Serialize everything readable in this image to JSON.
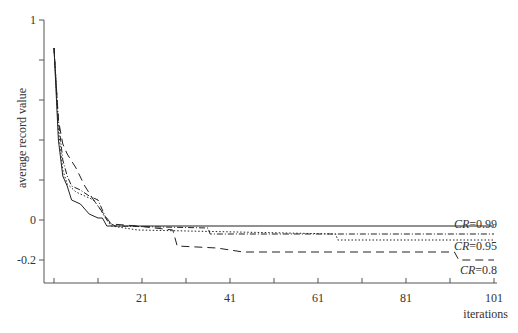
{
  "chart_data": {
    "type": "line",
    "title": "",
    "xlabel": "iterations",
    "ylabel": "average record value",
    "xlim": [
      1,
      101
    ],
    "ylim": [
      -0.3,
      1
    ],
    "x_ticks": [
      1,
      11,
      21,
      31,
      41,
      51,
      61,
      71,
      81,
      91,
      101
    ],
    "x_tick_labels": [
      "",
      "",
      "21",
      "",
      "41",
      "",
      "61",
      "",
      "81",
      "",
      "101"
    ],
    "y_ticks": [
      1,
      0.8,
      0.6,
      0.4,
      0.2,
      0,
      -0.2
    ],
    "y_tick_labels": [
      "1",
      "",
      "",
      "",
      "",
      "0",
      "-0.2"
    ],
    "grid": false,
    "legend": "inline labels at right end of lines",
    "series": [
      {
        "name": "CR=0.99",
        "style": "dash-dot",
        "points": [
          [
            1,
            0.86
          ],
          [
            2,
            0.5
          ],
          [
            3,
            0.3
          ],
          [
            4,
            0.22
          ],
          [
            5,
            0.17
          ],
          [
            7,
            0.15
          ],
          [
            9,
            0.12
          ],
          [
            11,
            0.1
          ],
          [
            13,
            0.0
          ],
          [
            14,
            -0.02
          ],
          [
            15,
            -0.03
          ],
          [
            36,
            -0.04
          ],
          [
            36.5,
            -0.07
          ],
          [
            101,
            -0.07
          ]
        ]
      },
      {
        "name": "CR=0.95",
        "style": "dotted",
        "points": [
          [
            1,
            0.86
          ],
          [
            2,
            0.45
          ],
          [
            3,
            0.25
          ],
          [
            4,
            0.18
          ],
          [
            6,
            0.14
          ],
          [
            8,
            0.12
          ],
          [
            10,
            0.1
          ],
          [
            11,
            0.07
          ],
          [
            13,
            0.0
          ],
          [
            14,
            -0.03
          ],
          [
            20,
            -0.05
          ],
          [
            65,
            -0.07
          ],
          [
            65.5,
            -0.1
          ],
          [
            101,
            -0.1
          ]
        ]
      },
      {
        "name": "CR=0.8",
        "style": "dashed",
        "points": [
          [
            1,
            0.86
          ],
          [
            2,
            0.5
          ],
          [
            3,
            0.38
          ],
          [
            4,
            0.33
          ],
          [
            6,
            0.26
          ],
          [
            8,
            0.17
          ],
          [
            10,
            0.1
          ],
          [
            12,
            0.04
          ],
          [
            14,
            -0.02
          ],
          [
            20,
            -0.03
          ],
          [
            28,
            -0.05
          ],
          [
            29,
            -0.13
          ],
          [
            38,
            -0.14
          ],
          [
            44,
            -0.16
          ],
          [
            92,
            -0.16
          ],
          [
            93,
            -0.2
          ],
          [
            101,
            -0.2
          ]
        ]
      },
      {
        "name": "baseline",
        "style": "solid",
        "points": [
          [
            1,
            0.86
          ],
          [
            2,
            0.4
          ],
          [
            3,
            0.22
          ],
          [
            4,
            0.17
          ],
          [
            5,
            0.1
          ],
          [
            7,
            0.08
          ],
          [
            9,
            0.03
          ],
          [
            11,
            0.01
          ],
          [
            12,
            0.01
          ],
          [
            13,
            -0.03
          ],
          [
            101,
            -0.03
          ]
        ]
      }
    ],
    "annotations": [
      "CR=0.99",
      "CR=0.95",
      "CR=0.8"
    ]
  }
}
